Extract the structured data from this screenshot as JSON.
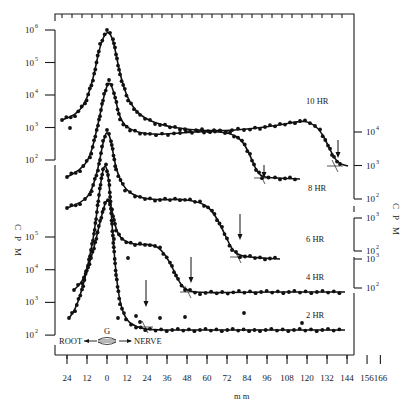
{
  "chart_data": {
    "type": "line",
    "title": "",
    "xlabel": "mm",
    "ylabel": "C P M",
    "y_scale": "log",
    "x_ticks": [
      "24",
      "12",
      "0",
      "12",
      "24",
      "36",
      "48",
      "60",
      "72",
      "84",
      "96",
      "108",
      "120",
      "132",
      "144",
      "156",
      "166"
    ],
    "x_range": [
      -30,
      170
    ],
    "direction_labels": {
      "left": "ROOT",
      "center": "G",
      "right": "NERVE"
    },
    "left_axis_upper": {
      "ticks": [
        "10^6",
        "10^5",
        "10^4",
        "10^3",
        "10^2"
      ],
      "range": [
        100,
        1000000
      ]
    },
    "left_axis_lower": {
      "ticks": [
        "10^5",
        "10^4",
        "10^3",
        "10^2"
      ],
      "range": [
        100,
        100000
      ]
    },
    "right_axis_groups": [
      {
        "ticks": [
          "10^4",
          "10^3",
          "10^2"
        ],
        "for": "8 HR"
      },
      {
        "ticks": [
          "10^3",
          "10^2"
        ],
        "for": "6 HR"
      },
      {
        "ticks": [
          "10^3",
          "10^2"
        ],
        "for": "4 HR"
      }
    ],
    "series": [
      {
        "name": "10 HR",
        "peak_mm": 0,
        "peak_cpm": 1000000,
        "front_arrow_mm": 158,
        "x": [
          -24,
          -12,
          -6,
          0,
          6,
          12,
          24,
          48,
          72,
          96,
          120,
          144,
          152,
          160,
          166
        ],
        "values": [
          1500,
          3000,
          30000,
          1000000,
          30000,
          5000,
          2000,
          1200,
          1200,
          1300,
          1500,
          1800,
          800,
          150,
          110
        ]
      },
      {
        "name": "8 HR",
        "peak_mm": 0,
        "peak_cpm": 20000,
        "front_arrow_mm": 112,
        "x": [
          -24,
          -12,
          -6,
          0,
          6,
          12,
          24,
          48,
          72,
          96,
          104,
          112,
          120
        ],
        "values": [
          150,
          400,
          2000,
          20000,
          3000,
          1500,
          1000,
          1100,
          1300,
          1000,
          400,
          120,
          100
        ]
      },
      {
        "name": "6 HR",
        "peak_mm": 0,
        "peak_cpm": 2000,
        "front_arrow_mm": 95,
        "x": [
          -24,
          -12,
          -6,
          0,
          6,
          12,
          24,
          48,
          60,
          72,
          84,
          95,
          108
        ],
        "values": [
          40,
          60,
          200,
          2000,
          500,
          120,
          90,
          100,
          110,
          90,
          40,
          20,
          20
        ]
      },
      {
        "name": "4 HR",
        "peak_mm": 0,
        "peak_cpm": 100000,
        "front_arrow_mm": 60,
        "x": [
          -24,
          -12,
          -6,
          0,
          6,
          12,
          24,
          36,
          48,
          56,
          62,
          72,
          96,
          120,
          144
        ],
        "values": [
          25000,
          30000,
          80000,
          100000,
          20000,
          6000,
          5000,
          4500,
          2500,
          600,
          200,
          180,
          180,
          180,
          180
        ]
      },
      {
        "name": "2 HR",
        "peak_mm": -2,
        "peak_cpm": 100000,
        "front_arrow_mm": 26,
        "x": [
          -24,
          -18,
          -12,
          -6,
          -2,
          4,
          10,
          18,
          26,
          36,
          60,
          96,
          132,
          144
        ],
        "values": [
          300,
          800,
          3000,
          20000,
          100000,
          30000,
          1500,
          250,
          150,
          120,
          130,
          120,
          120,
          130
        ]
      }
    ],
    "legend_position": "inline-right",
    "grid": false
  },
  "labels": {
    "x_axis_title": "m m",
    "y_axis_left": [
      "C",
      "P",
      "M"
    ],
    "y_axis_right": [
      "C",
      "P",
      "M"
    ],
    "series_tags": [
      "10 HR",
      "8 HR",
      "6 HR",
      "4 HR",
      "2 HR"
    ],
    "root": "ROOT",
    "nerve": "NERVE",
    "g": "G"
  },
  "ticks": {
    "x": [
      "24",
      "12",
      "0",
      "12",
      "24",
      "36",
      "48",
      "60",
      "72",
      "84",
      "96",
      "108",
      "120",
      "132",
      "144",
      "156",
      "166"
    ],
    "left_upper_base": "10",
    "left_upper_exp": [
      "6",
      "5",
      "4",
      "3",
      "2"
    ],
    "left_lower_exp": [
      "5",
      "4",
      "3",
      "2"
    ],
    "right_g1_exp": [
      "4",
      "3",
      "2"
    ],
    "right_g2_exp": [
      "3",
      "2"
    ],
    "right_g3_exp": [
      "3",
      "2"
    ]
  }
}
